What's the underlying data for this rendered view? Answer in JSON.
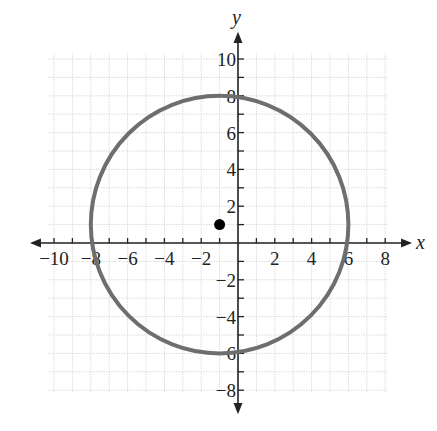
{
  "chart_data": {
    "type": "scatter",
    "title": "",
    "xlabel": "x",
    "ylabel": "y",
    "xlim": [
      -11,
      9
    ],
    "ylim": [
      -8.5,
      10.5
    ],
    "grid": true,
    "x_ticks": [
      -10,
      -8,
      -6,
      -4,
      -2,
      2,
      4,
      6,
      8
    ],
    "y_ticks": [
      10,
      8,
      6,
      4,
      2,
      -2,
      -4,
      -6,
      -8
    ],
    "shapes": [
      {
        "kind": "circle",
        "center": [
          -1,
          1
        ],
        "radius": 7,
        "color": "#6e6e6e",
        "intercepts": {
          "top": [
            -1,
            8
          ],
          "bottom": [
            -1,
            -6
          ],
          "left": [
            -8,
            1
          ],
          "right": [
            6,
            1
          ]
        }
      }
    ],
    "points": [
      {
        "x": -1,
        "y": 1,
        "label": "center",
        "color": "#000000"
      }
    ],
    "equation": "(x + 1)^2 + (y - 1)^2 = 49"
  },
  "colors": {
    "axis": "#222222",
    "grid": "#dcdcdc",
    "circle": "#6e6e6e",
    "point": "#000000"
  }
}
